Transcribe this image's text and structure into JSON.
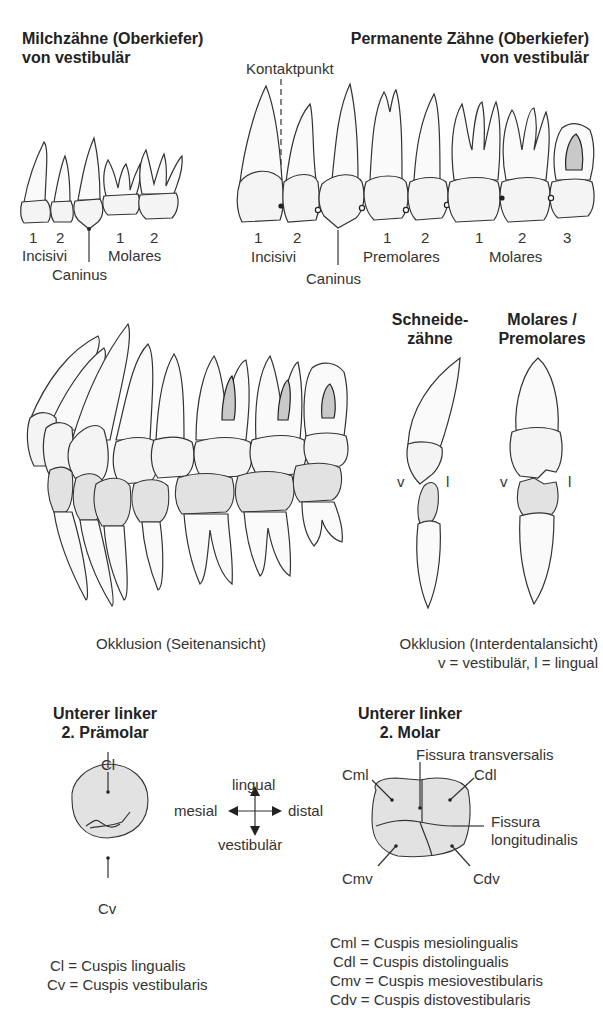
{
  "primary_teeth": {
    "title_line1": "Milchzähne (Oberkiefer)",
    "title_line2": "von vestibulär",
    "numbers": [
      "1",
      "2",
      "1",
      "2"
    ],
    "group_incisivi": "Incisivi",
    "group_molares": "Molares",
    "group_caninus": "Caninus"
  },
  "permanent_teeth": {
    "title_line1": "Permanente Zähne (Oberkiefer)",
    "title_line2": "von vestibulär",
    "contact_label": "Kontaktpunkt",
    "numbers": [
      "1",
      "2",
      "1",
      "2",
      "1",
      "2",
      "3"
    ],
    "group_incisivi": "Incisivi",
    "group_premolares": "Premolares",
    "group_molares": "Molares",
    "group_caninus": "Caninus"
  },
  "occlusion_side": {
    "caption": "Okklusion (Seitenansicht)"
  },
  "occlusion_interdental": {
    "header_incisors_line1": "Schneide-",
    "header_incisors_line2": "zähne",
    "header_molars_line1": "Molares /",
    "header_molars_line2": "Premolares",
    "v_label": "v",
    "l_label": "l",
    "caption": "Okklusion (Interdentalansicht)",
    "legend": "v = vestibulär,  l = lingual"
  },
  "premolar": {
    "title_line1": "Unterer linker",
    "title_line2": "2. Prämolar",
    "label_cl": "Cl",
    "label_cv": "Cv",
    "legend": [
      "Cl = Cuspis lingualis",
      "Cv = Cuspis vestibularis"
    ]
  },
  "orientation": {
    "up": "lingual",
    "down": "vestibulär",
    "left": "mesial",
    "right": "distal"
  },
  "molar": {
    "title_line1": "Unterer linker",
    "title_line2": "2. Molar",
    "label_fissura_transversalis": "Fissura transversalis",
    "label_fissura_longitudinalis_1": "Fissura",
    "label_fissura_longitudinalis_2": "longitudinalis",
    "label_cml": "Cml",
    "label_cdl": "Cdl",
    "label_cmv": "Cmv",
    "label_cdv": "Cdv",
    "legend": [
      "Cml = Cuspis mesiolingualis",
      "Cdl = Cuspis distolingualis",
      "Cmv = Cuspis mesiovestibularis",
      "Cdv = Cuspis distovestibularis"
    ]
  }
}
